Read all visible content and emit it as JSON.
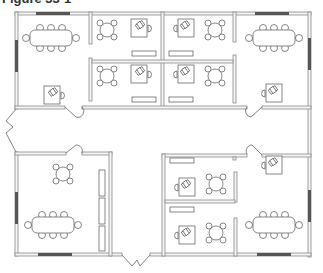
{
  "figure": {
    "title": "Figure 33-1"
  },
  "floor_plan": {
    "rooms": [
      {
        "id": "conference-nw",
        "type": "conference room",
        "furniture": [
          "conference table (6 chairs + 2 ends)",
          "desk with chair"
        ]
      },
      {
        "id": "office-n1",
        "type": "private office",
        "furniture": [
          "round table with 4 chairs",
          "desk with chair",
          "credenza"
        ]
      },
      {
        "id": "office-n2",
        "type": "private office",
        "furniture": [
          "round table with 4 chairs",
          "desk with chair",
          "credenza"
        ]
      },
      {
        "id": "office-n3",
        "type": "private office",
        "furniture": [
          "round table with 4 chairs",
          "desk with chair",
          "credenza"
        ]
      },
      {
        "id": "office-n4",
        "type": "private office",
        "furniture": [
          "round table with 4 chairs",
          "desk with chair",
          "credenza"
        ]
      },
      {
        "id": "conference-ne",
        "type": "conference room",
        "furniture": [
          "conference table (6 chairs + 2 ends)",
          "desk with chair"
        ]
      },
      {
        "id": "conference-sw",
        "type": "conference room",
        "furniture": [
          "round table with 4 chairs",
          "conference table (6 chairs + 2 ends)",
          "3 storage cabinets"
        ]
      },
      {
        "id": "office-s1",
        "type": "private office",
        "furniture": [
          "desk with chair",
          "round table with 4 chairs",
          "credenza"
        ]
      },
      {
        "id": "office-s2",
        "type": "private office",
        "furniture": [
          "desk with chair",
          "round table with 4 chairs",
          "credenza"
        ]
      },
      {
        "id": "conference-se",
        "type": "conference room",
        "furniture": [
          "desk with chair",
          "conference table (6 chairs + 2 ends)"
        ]
      }
    ],
    "corridors": [
      "main east-west corridor",
      "south entry corridor"
    ],
    "entrances": [
      "west entrance (double door)",
      "south entrance (double door)"
    ],
    "colors": {
      "wall_stroke": "#8a8a8a",
      "wall_fill": "#f4f4f4",
      "window": "#555555",
      "furniture": "#555555"
    }
  }
}
